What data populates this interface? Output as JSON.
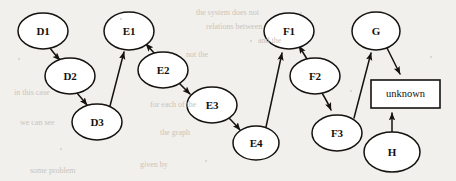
{
  "figure": {
    "background_color": "#f2f0ec",
    "ink_color": "#15120f",
    "node_fill": "#ffffff"
  },
  "nodes": [
    {
      "id": "D1",
      "label": "D1",
      "shape": "ellipse",
      "cx": 43,
      "cy": 31,
      "rx": 25,
      "ry": 18
    },
    {
      "id": "D2",
      "label": "D2",
      "shape": "ellipse",
      "cx": 70,
      "cy": 76,
      "rx": 25,
      "ry": 18
    },
    {
      "id": "D3",
      "label": "D3",
      "shape": "ellipse",
      "cx": 97,
      "cy": 122,
      "rx": 25,
      "ry": 18
    },
    {
      "id": "E1",
      "label": "E1",
      "shape": "ellipse",
      "cx": 129,
      "cy": 31,
      "rx": 25,
      "ry": 19
    },
    {
      "id": "E2",
      "label": "E2",
      "shape": "ellipse",
      "cx": 163,
      "cy": 70,
      "rx": 25,
      "ry": 18
    },
    {
      "id": "E3",
      "label": "E3",
      "shape": "ellipse",
      "cx": 212,
      "cy": 105,
      "rx": 25,
      "ry": 18
    },
    {
      "id": "E4",
      "label": "E4",
      "shape": "ellipse",
      "cx": 256,
      "cy": 143,
      "rx": 23,
      "ry": 17
    },
    {
      "id": "F1",
      "label": "F1",
      "shape": "ellipse",
      "cx": 289,
      "cy": 31,
      "rx": 25,
      "ry": 18
    },
    {
      "id": "F2",
      "label": "F2",
      "shape": "ellipse",
      "cx": 315,
      "cy": 76,
      "rx": 25,
      "ry": 18
    },
    {
      "id": "F3",
      "label": "F3",
      "shape": "ellipse",
      "cx": 337,
      "cy": 133,
      "rx": 25,
      "ry": 18
    },
    {
      "id": "G",
      "label": "G",
      "shape": "ellipse",
      "cx": 376,
      "cy": 31,
      "rx": 24,
      "ry": 19
    },
    {
      "id": "H",
      "label": "H",
      "shape": "ellipse",
      "cx": 392,
      "cy": 152,
      "rx": 28,
      "ry": 20
    },
    {
      "id": "unknown",
      "label": "unknown",
      "shape": "rect",
      "x": 371,
      "y": 80,
      "w": 69,
      "h": 28
    }
  ],
  "edges": [
    {
      "from": "D1",
      "to": "D2",
      "arrow": true
    },
    {
      "from": "D2",
      "to": "D3",
      "arrow": true
    },
    {
      "from": "D3",
      "to": "E1",
      "arrow": true
    },
    {
      "from": "E2",
      "to": "E1",
      "arrow": true
    },
    {
      "from": "E2",
      "to": "E3",
      "arrow": true
    },
    {
      "from": "E3",
      "to": "E4",
      "arrow": true
    },
    {
      "from": "E4",
      "to": "F1",
      "arrow": true
    },
    {
      "from": "F2",
      "to": "F1",
      "arrow": true
    },
    {
      "from": "F2",
      "to": "F3",
      "arrow": true
    },
    {
      "from": "F3",
      "to": "G",
      "arrow": true
    },
    {
      "from": "G",
      "to": "unknown",
      "arrow": true
    },
    {
      "from": "H",
      "to": "unknown",
      "arrow": true
    }
  ],
  "background_artifacts": [
    {
      "text": "the system does not",
      "x": 196,
      "y": 8
    },
    {
      "text": "relations between",
      "x": 206,
      "y": 22
    },
    {
      "text": "and the",
      "x": 258,
      "y": 36
    },
    {
      "text": "not the",
      "x": 186,
      "y": 50
    },
    {
      "text": "in this case",
      "x": 14,
      "y": 88
    },
    {
      "text": "for each of the",
      "x": 150,
      "y": 100
    },
    {
      "text": "we can see",
      "x": 20,
      "y": 118
    },
    {
      "text": "the graph",
      "x": 160,
      "y": 128
    },
    {
      "text": "given by",
      "x": 140,
      "y": 160
    },
    {
      "text": "some problem",
      "x": 30,
      "y": 166
    }
  ]
}
